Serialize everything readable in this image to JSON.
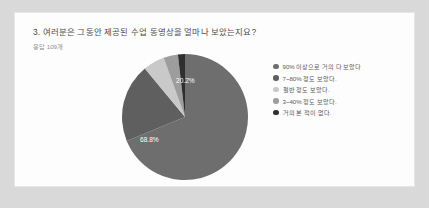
{
  "card": {
    "question_title": "3. 여러분은 그동안 제공된 수업 동영상을 얼마나 보았는지요?",
    "response_count": "응답 109개"
  },
  "chart_data": {
    "type": "pie",
    "title": "3. 여러분은 그동안 제공된 수업 동영상을 얼마나 보았는지요?",
    "subtitle": "응답 109개",
    "categories": [
      "90% 이상으로 거의 다 보았다",
      "7~80% 정도 보았다.",
      "절반 정도 보았다.",
      "3~40% 정도 보았다.",
      "거의 본 적이 없다."
    ],
    "values": [
      68.8,
      20.2,
      5.5,
      3.7,
      1.8
    ],
    "visible_labels": [
      "68.8%",
      "20.2%",
      "",
      "",
      ""
    ],
    "colors": [
      "#6e6e6e",
      "#5f5f5f",
      "#c9c9c9",
      "#9d9d9d",
      "#2f2f2f"
    ],
    "legend_position": "right",
    "grid": false
  },
  "legend": {
    "items": [
      {
        "label": "90% 이상으로 거의 다 보았다",
        "color": "#6e6e6e"
      },
      {
        "label": "7~80% 정도 보았다.",
        "color": "#5f5f5f"
      },
      {
        "label": "절반 정도 보았다.",
        "color": "#c9c9c9"
      },
      {
        "label": "3~40% 정도 보았다.",
        "color": "#9d9d9d"
      },
      {
        "label": "거의 본 적이 없다.",
        "color": "#2f2f2f"
      }
    ]
  },
  "labels": {
    "major": "68.8%",
    "second": "20.2%"
  }
}
